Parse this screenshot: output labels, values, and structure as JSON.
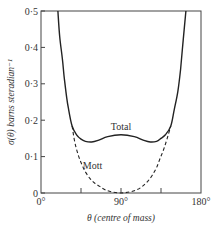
{
  "chart_data": {
    "type": "line",
    "title": "",
    "xlabel": "θ (centre of mass)",
    "ylabel": "σ(θ) barns steradian⁻¹",
    "xlim": [
      0,
      180
    ],
    "ylim": [
      0,
      0.5
    ],
    "x_ticks": [
      0,
      45,
      90,
      135,
      180
    ],
    "x_tick_labels": [
      "0°",
      "",
      "90°",
      "",
      "180°"
    ],
    "y_ticks": [
      0,
      0.1,
      0.2,
      0.3,
      0.4,
      0.5
    ],
    "y_tick_labels": [
      "0",
      "0·1",
      "0·2",
      "0·3",
      "0·4",
      "0·5"
    ],
    "grid": false,
    "legend": "inline labels",
    "series": [
      {
        "name": "Total",
        "style": "solid",
        "x": [
          19,
          21,
          24,
          26,
          29,
          31,
          35,
          40,
          45,
          50,
          57,
          65,
          75,
          90,
          105,
          115,
          123,
          130,
          135,
          140,
          146,
          150,
          154,
          157,
          160,
          163
        ],
        "values": [
          0.5,
          0.43,
          0.37,
          0.32,
          0.26,
          0.23,
          0.184,
          0.16,
          0.148,
          0.142,
          0.14,
          0.145,
          0.155,
          0.16,
          0.155,
          0.145,
          0.14,
          0.142,
          0.15,
          0.16,
          0.184,
          0.23,
          0.28,
          0.34,
          0.42,
          0.5
        ]
      },
      {
        "name": "Mott",
        "style": "dashed",
        "x": [
          35,
          38,
          42,
          46,
          50,
          55,
          60,
          66,
          72,
          80,
          90,
          100,
          108,
          114,
          120,
          125,
          130,
          134,
          138,
          142,
          146
        ],
        "values": [
          0.184,
          0.14,
          0.104,
          0.078,
          0.058,
          0.04,
          0.028,
          0.018,
          0.009,
          0.003,
          0.0,
          0.003,
          0.009,
          0.018,
          0.032,
          0.048,
          0.07,
          0.095,
          0.12,
          0.15,
          0.184
        ]
      }
    ],
    "annotations": [
      {
        "text": "Total",
        "x": 90,
        "y": 0.172
      },
      {
        "text": "Mott",
        "x": 58,
        "y": 0.065
      }
    ]
  }
}
